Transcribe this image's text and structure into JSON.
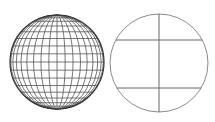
{
  "diagram": {
    "background": "#ffffff",
    "globe": {
      "cx": 57,
      "cy": 62,
      "r": 47,
      "meridian_step_deg": 10,
      "parallel_step_deg": 10,
      "stroke": "#555555",
      "outline_stroke": "#333333"
    },
    "plain_circle": {
      "cx": 159,
      "cy": 63,
      "r": 49,
      "stroke": "#8a8a8a",
      "vertical_line_x": 159,
      "horizontal_lines_y": [
        40,
        88
      ]
    }
  }
}
